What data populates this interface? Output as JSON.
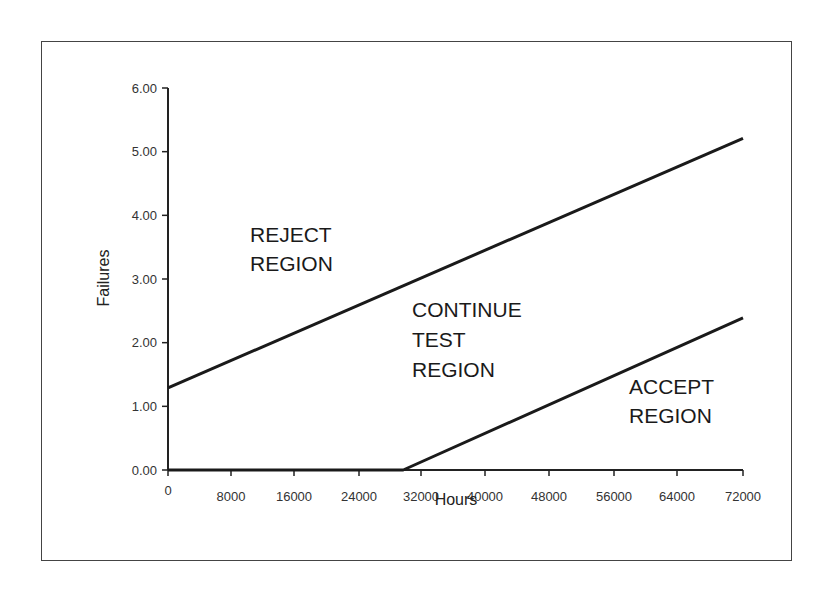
{
  "chart_data": {
    "type": "line",
    "title": "",
    "xlabel": "Hours",
    "ylabel": "Failures",
    "x_ticks": [
      "0",
      "8000",
      "16000",
      "24000",
      "32000",
      "40000",
      "48000",
      "56000",
      "64000",
      "72000"
    ],
    "x_tick_values": [
      0,
      8000,
      16000,
      24000,
      32000,
      40000,
      48000,
      56000,
      64000,
      72000
    ],
    "y_ticks": [
      "0.00",
      "1.00",
      "2.00",
      "3.00",
      "4.00",
      "5.00",
      "6.00"
    ],
    "xlim": [
      0,
      72000
    ],
    "ylim": [
      0,
      6
    ],
    "grid": false,
    "legend": null,
    "series": [
      {
        "name": "Reject line",
        "x": [
          0,
          72000
        ],
        "y": [
          1.29,
          5.21
        ]
      },
      {
        "name": "Accept line",
        "x": [
          0,
          29700,
          72000
        ],
        "y": [
          0,
          0,
          2.39
        ]
      }
    ],
    "annotations": [
      {
        "lines": [
          "REJECT",
          "REGION"
        ],
        "x": 9500,
        "y": 3.5
      },
      {
        "lines": [
          "CONTINUE",
          "TEST",
          "REGION"
        ],
        "x": 34000,
        "y": 2.4
      },
      {
        "lines": [
          "ACCEPT",
          "REGION"
        ],
        "x": 53000,
        "y": 1.0
      }
    ]
  },
  "labels": {
    "xlabel": "Hours",
    "ylabel": "Failures",
    "reject": [
      "REJECT",
      "REGION"
    ],
    "continue": [
      "CONTINUE",
      "TEST",
      "REGION"
    ],
    "accept": [
      "ACCEPT",
      "REGION"
    ]
  }
}
